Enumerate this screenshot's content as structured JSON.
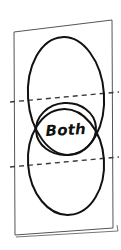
{
  "figure": {
    "kind": "hand-drawn-venn-diagram",
    "background_color": "#ffffff",
    "ink_color": "#111111",
    "page_outline_color": "#555555",
    "dashed_line_color": "#3a3a3a"
  },
  "page": {
    "name": "tilted-page",
    "corners": {
      "top_left": [
        14,
        32
      ],
      "top_right": [
        112,
        20
      ],
      "bottom_right": [
        113,
        228
      ],
      "bottom_left": [
        15,
        235
      ]
    },
    "shadow_edge": {
      "from": [
        16,
        237
      ],
      "to": [
        118,
        231
      ]
    },
    "stroke_width": 1
  },
  "sets": [
    {
      "name": "upper-set",
      "shape": "ellipse",
      "center": [
        66,
        96
      ],
      "radius_x": 38,
      "radius_y": 59,
      "rotation_deg": -4,
      "stroke_width": 2,
      "label": ""
    },
    {
      "name": "lower-set",
      "shape": "ellipse",
      "center": [
        66,
        162
      ],
      "radius_x": 38,
      "radius_y": 53,
      "rotation_deg": -4,
      "stroke_width": 2,
      "label": ""
    }
  ],
  "intersection": {
    "name": "both-region",
    "shape": "circle",
    "center": [
      66,
      129
    ],
    "radius_x": 30,
    "radius_y": 26,
    "rotation_deg": -4,
    "stroke_width": 2,
    "label": "Both",
    "label_position": [
      66,
      135
    ]
  },
  "dashed_lines": [
    {
      "name": "upper-intersection-line",
      "from": [
        10,
        102
      ],
      "to": [
        119,
        92
      ],
      "dash": "5 4",
      "stroke_width": 1.4
    },
    {
      "name": "lower-intersection-line",
      "from": [
        10,
        167
      ],
      "to": [
        119,
        157
      ],
      "dash": "5 4",
      "stroke_width": 1.4
    }
  ]
}
